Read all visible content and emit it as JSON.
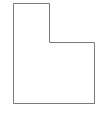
{
  "diagram": {
    "shape": "L-shaped polygon outline",
    "points": [
      [
        13,
        3
      ],
      [
        49,
        3
      ],
      [
        49,
        42
      ],
      [
        94,
        42
      ],
      [
        94,
        103
      ],
      [
        13,
        103
      ]
    ],
    "stroke_color": "#7a7a7a",
    "fill_color": "#ffffff",
    "stroke_width": 1
  }
}
